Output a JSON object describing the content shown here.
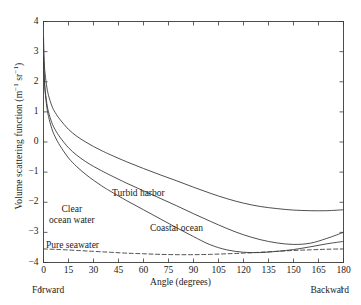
{
  "chart_data": {
    "type": "line",
    "title": "",
    "xlabel": "Angle (degrees)",
    "ylabel": "Volume scattering function  (m⁻¹ sr⁻¹)",
    "ylabel_parts": {
      "text": "Volume scattering function  (m",
      "sup1": "−1",
      "mid": " sr",
      "sup2": "−1",
      "tail": ")"
    },
    "xlim": [
      0,
      180
    ],
    "ylim": [
      -4,
      4
    ],
    "xticks": [
      0,
      15,
      30,
      45,
      60,
      75,
      90,
      105,
      120,
      135,
      150,
      165,
      180
    ],
    "xtick_labels": [
      "0",
      "15",
      "30",
      "45",
      "60",
      "75",
      "90",
      "105",
      "120",
      "135",
      "150",
      "165",
      "180"
    ],
    "yticks": [
      -4,
      -3,
      -2,
      -1,
      0,
      1,
      2,
      3,
      4
    ],
    "ytick_labels": [
      "−4",
      "−3",
      "−2",
      "−1",
      "0",
      "1",
      "2",
      "3",
      "4"
    ],
    "grid": false,
    "legend_position": "inline-annotations",
    "axis_note_left": "Forward",
    "axis_note_right": "Backward",
    "arrow_glyph": "↑",
    "line_color": "#3b3b3b",
    "series": [
      {
        "name": "Turbid harbor",
        "style": "solid",
        "label_x": 112,
        "label_y": 188,
        "x": [
          0,
          0.5,
          1,
          2,
          3,
          5,
          7,
          10,
          15,
          20,
          25,
          30,
          35,
          40,
          50,
          60,
          70,
          80,
          90,
          100,
          110,
          120,
          130,
          140,
          150,
          160,
          170,
          180
        ],
        "y": [
          3.5,
          2.62,
          2.25,
          1.82,
          1.55,
          1.2,
          0.98,
          0.74,
          0.42,
          0.19,
          0.01,
          -0.15,
          -0.29,
          -0.42,
          -0.66,
          -0.88,
          -1.09,
          -1.29,
          -1.5,
          -1.7,
          -1.88,
          -2.03,
          -2.14,
          -2.21,
          -2.26,
          -2.28,
          -2.28,
          -2.25
        ]
      },
      {
        "name": "Coastal ocean",
        "style": "solid",
        "label_x": 150,
        "label_y": 223,
        "x": [
          0,
          0.5,
          1,
          2,
          3,
          5,
          7,
          10,
          15,
          20,
          25,
          30,
          35,
          40,
          50,
          60,
          70,
          80,
          90,
          100,
          110,
          120,
          130,
          140,
          150,
          160,
          170,
          180
        ],
        "y": [
          2.85,
          2.1,
          1.72,
          1.28,
          1.0,
          0.64,
          0.41,
          0.15,
          -0.19,
          -0.44,
          -0.64,
          -0.81,
          -0.96,
          -1.1,
          -1.37,
          -1.62,
          -1.87,
          -2.12,
          -2.38,
          -2.63,
          -2.87,
          -3.08,
          -3.24,
          -3.35,
          -3.4,
          -3.36,
          -3.2,
          -3.0
        ]
      },
      {
        "name": "Clear ocean water",
        "style": "solid",
        "label_x": 49,
        "label_y": 204,
        "x": [
          0,
          0.5,
          1,
          2,
          3,
          5,
          7,
          10,
          15,
          20,
          25,
          30,
          35,
          40,
          50,
          60,
          70,
          80,
          90,
          100,
          110,
          120,
          130,
          140,
          150,
          160,
          170,
          180
        ],
        "y": [
          2.85,
          2.08,
          1.66,
          1.16,
          0.85,
          0.44,
          0.17,
          -0.13,
          -0.53,
          -0.82,
          -1.06,
          -1.27,
          -1.46,
          -1.63,
          -1.95,
          -2.25,
          -2.55,
          -2.85,
          -3.14,
          -3.41,
          -3.58,
          -3.66,
          -3.67,
          -3.63,
          -3.57,
          -3.48,
          -3.38,
          -3.3
        ]
      },
      {
        "name": "Pure seawater",
        "style": "dashed",
        "label_x": 46,
        "label_y": 240,
        "x": [
          0,
          10,
          20,
          30,
          40,
          50,
          60,
          70,
          80,
          90,
          100,
          110,
          120,
          130,
          140,
          150,
          160,
          170,
          180
        ],
        "y": [
          -3.55,
          -3.57,
          -3.6,
          -3.63,
          -3.66,
          -3.69,
          -3.71,
          -3.73,
          -3.74,
          -3.74,
          -3.73,
          -3.71,
          -3.69,
          -3.66,
          -3.63,
          -3.6,
          -3.58,
          -3.56,
          -3.55
        ]
      }
    ]
  }
}
